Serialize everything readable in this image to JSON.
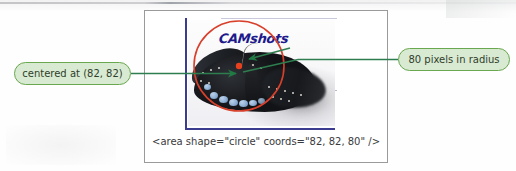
{
  "figure": {
    "code_caption": "<area shape=\"circle\" coords=\"82, 82, 80\" />",
    "image": {
      "wordmark": "CAMshots",
      "subject": "butterfly-photo",
      "overlay_shape": "circle",
      "center_x": 82,
      "center_y": 82,
      "radius": 80,
      "circle_color": "#d8402c",
      "center_dot_color": "#e8411f",
      "axis_color": "#3b3c8f",
      "wordmark_color": "#1d1a8c"
    }
  },
  "callouts": {
    "left": {
      "label": "centered at (82, 82)",
      "fill": "#d9ead3",
      "border": "#6aa84f",
      "text_color": "#2f3e2a"
    },
    "right": {
      "label": "80 pixels in radius",
      "fill": "#d9ead3",
      "border": "#6aa84f",
      "text_color": "#2f3e2a"
    }
  },
  "leader_lines": {
    "color": "#2e7d4f",
    "arrow_color": "#1f7a44"
  },
  "frame": {
    "border_color": "#9a9a9a"
  }
}
